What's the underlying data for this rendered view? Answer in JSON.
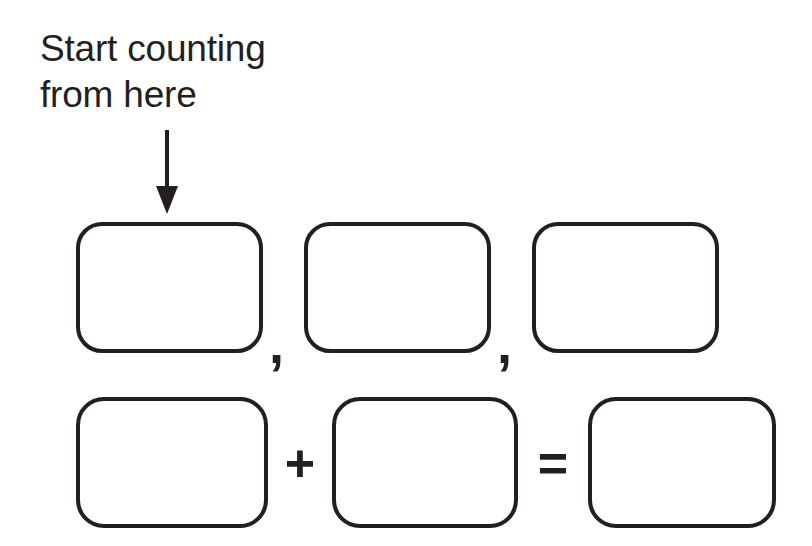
{
  "page": {
    "background_color": "#ffffff",
    "ink_color": "#231f20"
  },
  "annotation": {
    "text": "Start counting\nfrom here",
    "line_1": "Start counting",
    "line_2": "from here",
    "pointer_icon": "down-arrow-icon",
    "points_to": "sequence-box-1"
  },
  "sequence_row": {
    "separator": ",",
    "boxes": [
      {
        "label": "sequence-box-1",
        "value": ""
      },
      {
        "label": "sequence-box-2",
        "value": ""
      },
      {
        "label": "sequence-box-3",
        "value": ""
      }
    ]
  },
  "equation_row": {
    "plus": "+",
    "equals": "=",
    "boxes": [
      {
        "label": "addend-box-1",
        "value": ""
      },
      {
        "label": "addend-box-2",
        "value": ""
      },
      {
        "label": "sum-box",
        "value": ""
      }
    ]
  }
}
